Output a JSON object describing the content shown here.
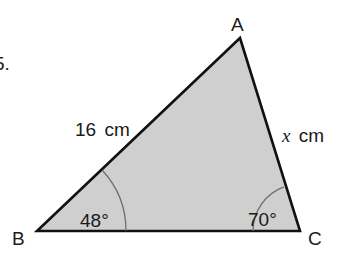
{
  "question_fragment": "5.",
  "triangle": {
    "fill_color": "#cfcfcf",
    "stroke_color": "#111111",
    "arc_color": "#6e6e6e",
    "vertices": {
      "A": {
        "label": "A",
        "x": 240,
        "y": 38
      },
      "B": {
        "label": "B",
        "x": 37,
        "y": 231
      },
      "C": {
        "label": "C",
        "x": 300,
        "y": 231
      }
    },
    "sides": {
      "AB": {
        "length_value": "16",
        "unit": "cm",
        "label": "16 cm"
      },
      "AC": {
        "length_value": "x",
        "unit": "cm",
        "label": "x cm"
      }
    },
    "angles": {
      "B": {
        "value": "48°"
      },
      "C": {
        "value": "70°"
      }
    }
  }
}
